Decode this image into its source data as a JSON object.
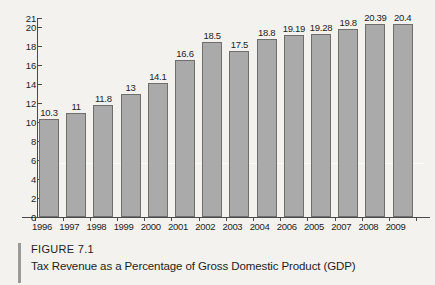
{
  "caption": {
    "figure_label": "FIGURE 7.1",
    "title": "Tax Revenue as a Percentage of Gross Domestic Product (GDP)"
  },
  "chart_data": {
    "type": "bar",
    "title": "Tax Revenue as a Percentage of Gross Domestic Product (GDP)",
    "xlabel": "",
    "ylabel": "",
    "ylim": [
      0,
      21
    ],
    "grid": false,
    "legend": "none",
    "yticks": [
      0,
      2,
      4,
      6,
      8,
      10,
      12,
      14,
      16,
      18,
      20,
      21
    ],
    "categories": [
      "1996",
      "1997",
      "1998",
      "1999",
      "2000",
      "2001",
      "2002",
      "2003",
      "2004",
      "2006",
      "2005",
      "2007",
      "2008",
      "2009"
    ],
    "values": [
      10.3,
      11,
      11.8,
      13,
      14.1,
      16.6,
      18.5,
      17.5,
      18.8,
      19.19,
      19.28,
      19.8,
      20.39,
      20.4
    ],
    "value_labels": [
      "10.3",
      "11",
      "11.8",
      "13",
      "14.1",
      "16.6",
      "18.5",
      "17.5",
      "18.8",
      "19.19",
      "19.28",
      "19.8",
      "20.39",
      "20.4"
    ],
    "bar_color": "#aaaaaa",
    "bar_edge_color": "#6e6e6e"
  }
}
